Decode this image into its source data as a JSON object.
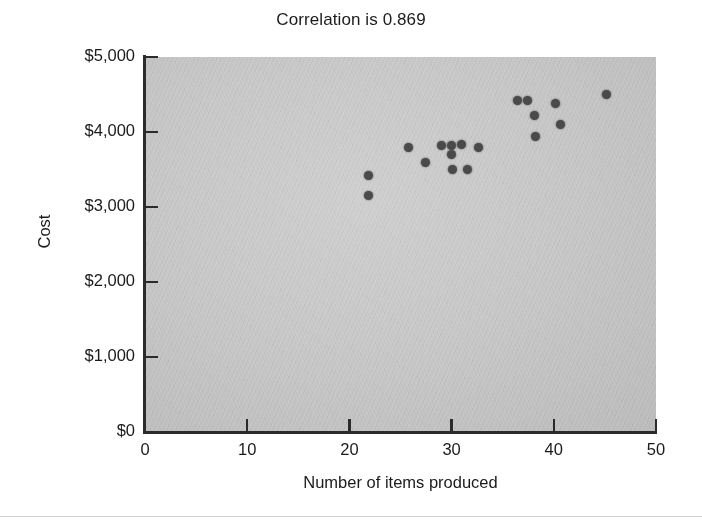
{
  "chart_data": {
    "type": "scatter",
    "title": "Correlation is 0.869",
    "xlabel": "Number of items produced",
    "ylabel": "Cost",
    "xlim": [
      0,
      50
    ],
    "ylim": [
      0,
      5000
    ],
    "grid": false,
    "legend": null,
    "correlation": 0.869,
    "xticks": [
      0,
      10,
      20,
      30,
      40,
      50
    ],
    "xtick_labels": [
      "0",
      "10",
      "20",
      "30",
      "40",
      "50"
    ],
    "yticks": [
      0,
      1000,
      2000,
      3000,
      4000,
      5000
    ],
    "ytick_labels": [
      "$0",
      "$1,000",
      "$2,000",
      "$3,000",
      "$4,000",
      "$5,000"
    ],
    "marker_color": "#4a4a4a",
    "panel_color": "#c9c9c9",
    "points": [
      {
        "x": 21.9,
        "y": 3425
      },
      {
        "x": 21.9,
        "y": 3160
      },
      {
        "x": 25.8,
        "y": 3800
      },
      {
        "x": 27.4,
        "y": 3600
      },
      {
        "x": 29.0,
        "y": 3815
      },
      {
        "x": 30.0,
        "y": 3825
      },
      {
        "x": 30.0,
        "y": 3695
      },
      {
        "x": 30.1,
        "y": 3495
      },
      {
        "x": 31.0,
        "y": 3840
      },
      {
        "x": 31.6,
        "y": 3495
      },
      {
        "x": 32.6,
        "y": 3790
      },
      {
        "x": 36.4,
        "y": 4425
      },
      {
        "x": 37.4,
        "y": 4425
      },
      {
        "x": 38.1,
        "y": 4215
      },
      {
        "x": 38.2,
        "y": 3935
      },
      {
        "x": 40.2,
        "y": 4375
      },
      {
        "x": 40.7,
        "y": 4105
      },
      {
        "x": 45.2,
        "y": 4495
      }
    ]
  }
}
